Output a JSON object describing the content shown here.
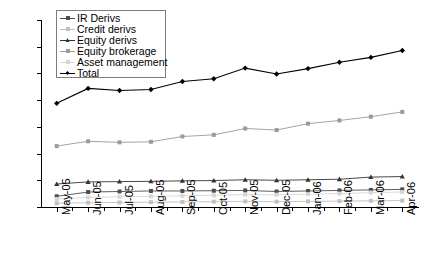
{
  "chart_data": {
    "type": "line",
    "title": "",
    "xlabel": "",
    "ylabel": "",
    "ylim": [
      0,
      35000
    ],
    "ytick_step": 5000,
    "grid": false,
    "legend_position": "top-left",
    "categories": [
      "May-05",
      "Jun-05",
      "Jul-05",
      "Aug-05",
      "Sep-05",
      "Oct-05",
      "Nov-05",
      "Dec-05",
      "Jan-06",
      "Feb-06",
      "Mar-06",
      "Apr-06"
    ],
    "ytick_labels": [
      "35000",
      "30000",
      "25000",
      "20000",
      "15000",
      "10000",
      "5000",
      "0"
    ],
    "series": [
      {
        "name": "IR Derivs",
        "color": "#4d4d4d",
        "marker": "square",
        "values": [
          2000,
          2800,
          2900,
          3000,
          3000,
          3050,
          3100,
          2900,
          3000,
          3100,
          3200,
          3300
        ]
      },
      {
        "name": "Credit derivs",
        "color": "#c0c0c0",
        "marker": "square",
        "values": [
          700,
          800,
          850,
          900,
          950,
          1000,
          1050,
          1000,
          1050,
          1100,
          1150,
          1200
        ]
      },
      {
        "name": "Equity derivs",
        "color": "#333333",
        "marker": "triangle",
        "values": [
          4300,
          4700,
          4750,
          4800,
          4900,
          4950,
          5100,
          5000,
          5100,
          5200,
          5600,
          5700
        ]
      },
      {
        "name": "Equity brokerage",
        "color": "#9a9a9a",
        "marker": "square",
        "values": [
          11400,
          12300,
          12100,
          12200,
          13200,
          13500,
          14700,
          14400,
          15600,
          16200,
          16900,
          17800
        ]
      },
      {
        "name": "Asset management",
        "color": "#d6d6d6",
        "marker": "square",
        "values": [
          1500,
          1800,
          1900,
          2000,
          2100,
          2200,
          2300,
          2300,
          2400,
          2500,
          2700,
          2800
        ]
      },
      {
        "name": "Total",
        "color": "#000000",
        "marker": "diamond",
        "values": [
          19400,
          22200,
          21800,
          22000,
          23500,
          24000,
          26000,
          24900,
          25900,
          27100,
          28000,
          29300
        ]
      }
    ]
  },
  "legend": {
    "items": [
      {
        "label": "IR Derivs"
      },
      {
        "label": "Credit derivs"
      },
      {
        "label": "Equity derivs"
      },
      {
        "label": "Equity brokerage"
      },
      {
        "label": "Asset management"
      },
      {
        "label": "Total"
      }
    ]
  }
}
